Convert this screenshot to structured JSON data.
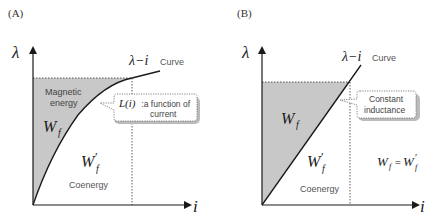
{
  "panels": [
    {
      "label": "(A)",
      "y_axis_label": "λ",
      "x_axis_label": "i",
      "curve_label_symbol": "λ−i",
      "curve_label_text": "Curve",
      "shaded_region_title_line1": "Magnetic",
      "shaded_region_title_line2": "energy",
      "energy_symbol": "W",
      "energy_subscript": "f",
      "coenergy_symbol": "W",
      "coenergy_prime": "′",
      "coenergy_subscript": "f",
      "coenergy_text": "Coenergy",
      "callout_symbol": "L(i)",
      "callout_line1": " :a function of",
      "callout_line2": "current",
      "curve_type": "nonlinear (saturating)"
    },
    {
      "label": "(B)",
      "y_axis_label": "λ",
      "x_axis_label": "i",
      "curve_label_symbol": "λ−i",
      "curve_label_text": "Curve",
      "energy_symbol": "W",
      "energy_subscript": "f",
      "coenergy_symbol": "W",
      "coenergy_prime": "′",
      "coenergy_subscript": "f",
      "coenergy_text": "Coenergy",
      "callout_line1": "Constant",
      "callout_line2": "inductance",
      "equation_lhs": "W",
      "equation_lhs_sub": "f",
      "equation_eq": " = ",
      "equation_rhs": "W",
      "equation_rhs_prime": "′",
      "equation_rhs_sub": "f",
      "curve_type": "linear"
    }
  ],
  "colors": {
    "shade": "#c8c8c8",
    "axis": "#1a1a1a",
    "text_gray": "#555555",
    "callout_border": "#666666",
    "callout_shadow": "#bbbbbb"
  }
}
